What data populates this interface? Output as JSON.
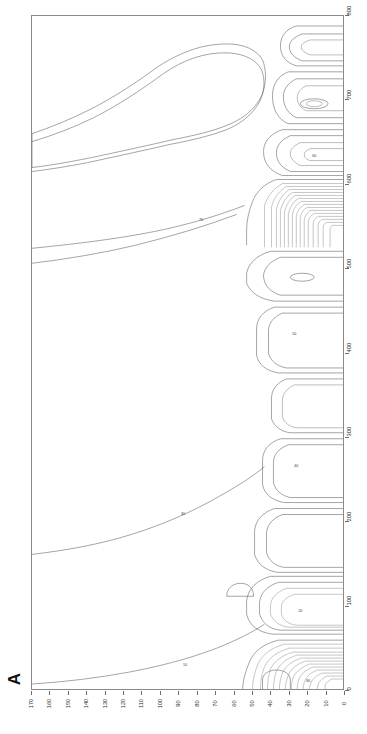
{
  "figure": {
    "panel_label": "A",
    "background_color": "#ffffff",
    "line_color": "#5a5a5a",
    "frame_color": "#8a8a8a"
  },
  "chart_data": {
    "type": "line",
    "title": "A",
    "subtitle": "",
    "xlabel": "",
    "ylabel": "",
    "orientation": "rotated-90",
    "grid": false,
    "legend": null,
    "x_axis": {
      "name": "depth-axis",
      "position": "bottom",
      "direction": "descending",
      "range": [
        170,
        0
      ],
      "ticks": [
        170,
        160,
        150,
        140,
        130,
        120,
        110,
        100,
        90,
        80,
        70,
        60,
        50,
        40,
        30,
        20,
        10,
        0
      ],
      "tick_labels": [
        "170",
        "160",
        "150",
        "140",
        "130",
        "120",
        "110",
        "100",
        "90",
        "80",
        "70",
        "60",
        "50",
        "40",
        "30",
        "20",
        "10",
        "0"
      ]
    },
    "y_axis": {
      "name": "distance-axis",
      "position": "right",
      "direction": "ascending",
      "range": [
        0,
        800
      ],
      "ticks": [
        0,
        100,
        200,
        300,
        400,
        500,
        600,
        700,
        800
      ],
      "tick_labels": [
        "0",
        "100",
        "200",
        "300",
        "400",
        "500",
        "600",
        "700",
        "800"
      ]
    },
    "contour_labels": [
      "10",
      "20",
      "30",
      "40",
      "50",
      "60",
      "70",
      "80"
    ],
    "series": [
      {
        "name": "contour-10",
        "value": 10
      },
      {
        "name": "contour-20",
        "value": 20
      },
      {
        "name": "contour-30",
        "value": 30
      },
      {
        "name": "contour-40",
        "value": 40
      },
      {
        "name": "contour-50",
        "value": 50
      },
      {
        "name": "contour-60",
        "value": 60
      },
      {
        "name": "contour-70",
        "value": 70
      },
      {
        "name": "contour-80",
        "value": 80
      }
    ]
  }
}
